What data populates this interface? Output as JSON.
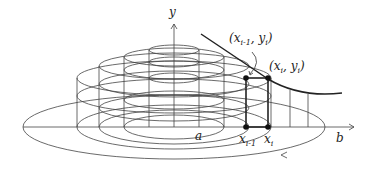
{
  "figure": {
    "labels": {
      "y_axis": "y",
      "a": "a",
      "b": "b",
      "x_prev_main": "x",
      "x_prev_sub": "i-1",
      "x_i_main": "x",
      "x_i_sub": "i",
      "point_prev": "(x",
      "point_prev_sub": "i-1",
      "point_prev_rest": ", y",
      "point_prev_ysub": "i",
      "point_prev_close": ")",
      "point_i": "(x",
      "point_i_sub": "i",
      "point_i_rest": ", y",
      "point_i_ysub": "i",
      "point_i_close": ")"
    },
    "colors": {
      "stroke": "#333333",
      "background": "#ffffff"
    }
  }
}
